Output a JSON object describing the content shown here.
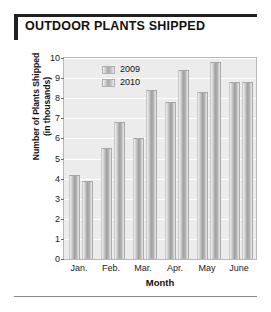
{
  "chart_title": "OUTDOOR PLANTS SHIPPED",
  "chart_data": {
    "type": "bar",
    "title": "OUTDOOR PLANTS SHIPPED",
    "xlabel": "Month",
    "ylabel": "Number of Plants Shipped (in thousands)",
    "ylabel_line1": "Number of Plants Shipped",
    "ylabel_line2": "(in thousands)",
    "categories": [
      "Jan.",
      "Feb.",
      "Mar.",
      "Apr.",
      "May",
      "June"
    ],
    "series": [
      {
        "name": "2009",
        "values": [
          4.2,
          5.5,
          6.0,
          7.8,
          8.3,
          8.8
        ]
      },
      {
        "name": "2010",
        "values": [
          3.9,
          6.8,
          8.4,
          9.4,
          9.8,
          8.8
        ]
      }
    ],
    "ylim": [
      0,
      10
    ],
    "ytick_labels": [
      "10",
      "9",
      "8",
      "7",
      "6",
      "5",
      "4",
      "3",
      "2",
      "1",
      "0"
    ],
    "ytick_values": [
      10,
      9,
      8,
      7,
      6,
      5,
      4,
      3,
      2,
      1,
      0
    ],
    "grid": true,
    "legend_position": "top-left-inside",
    "legend_entries": [
      "2009",
      "2010"
    ],
    "colors": {
      "bar_light": "#f4f4f4",
      "bar_mid": "#9e9ea0",
      "plot_background": "#ececed",
      "gridline": "#ffffff",
      "title_bar": "#231f20"
    }
  }
}
